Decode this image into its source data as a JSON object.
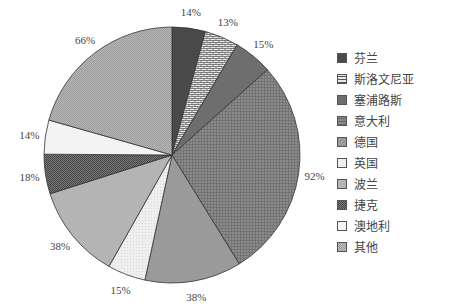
{
  "chart_data": {
    "type": "pie",
    "title": "",
    "start": "top",
    "direction": "clockwise",
    "legend_position": "right",
    "slices": [
      {
        "name": "芬兰",
        "label": "14%",
        "share_pct": 4.2,
        "color": "#4a4a4a",
        "pattern": "solid"
      },
      {
        "name": "斯洛文尼亚",
        "label": "13%",
        "share_pct": 4.3,
        "color": "#dcdcdc",
        "pattern": "brick"
      },
      {
        "name": "塞浦路斯",
        "label": "15%",
        "share_pct": 4.9,
        "color": "#6e6e6e",
        "pattern": "solid"
      },
      {
        "name": "意大利",
        "label": "92%",
        "share_pct": 27.8,
        "color": "#7d7d7d",
        "pattern": "grid"
      },
      {
        "name": "德国",
        "label": "38%",
        "share_pct": 12.2,
        "color": "#9a9a9a",
        "pattern": "solid"
      },
      {
        "name": "英国",
        "label": "15%",
        "share_pct": 4.8,
        "color": "#f0f0f0",
        "pattern": "dots"
      },
      {
        "name": "波兰",
        "label": "38%",
        "share_pct": 11.9,
        "color": "#b4b4b4",
        "pattern": "solid"
      },
      {
        "name": "捷克",
        "label": "18%",
        "share_pct": 5.0,
        "color": "#5e5e5e",
        "pattern": "checker"
      },
      {
        "name": "澳地利",
        "label": "14%",
        "share_pct": 4.3,
        "color": "#f3f3f3",
        "pattern": "solid"
      },
      {
        "name": "其他",
        "label": "66%",
        "share_pct": 20.6,
        "color": "#a8a8a8",
        "pattern": "checker"
      }
    ]
  }
}
